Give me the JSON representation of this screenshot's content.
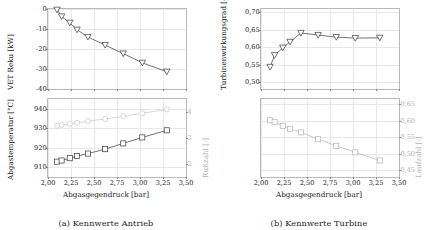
{
  "figure": {
    "subfigures": [
      {
        "tag": "(a)",
        "caption": "(a) Kennwerte Antrieb"
      },
      {
        "tag": "(b)",
        "caption": "(b) Kennwerte Turbine"
      }
    ],
    "xaxis_title": "Abgasgegendruck [bar]",
    "xticks": [
      "2,00",
      "2,25",
      "2,50",
      "2,75",
      "3,00",
      "3,25",
      "3,50"
    ]
  },
  "chart_data": [
    {
      "type": "line",
      "title": "(a) Kennwerte Antrieb",
      "panel": "top-left",
      "xlabel": "Abgasgegendruck [bar]",
      "ylabel": "VET Reku [kW]",
      "xlim": [
        2.0,
        3.5
      ],
      "ylim": [
        -40,
        0
      ],
      "xticks": [
        2.0,
        2.25,
        2.5,
        2.75,
        3.0,
        3.25,
        3.5
      ],
      "yticks": [
        0,
        -10,
        -20,
        -30,
        -40
      ],
      "ytick_labels": [
        "0",
        "-10",
        "-20",
        "-30",
        "-40"
      ],
      "grid": true,
      "legend": "none",
      "series": [
        {
          "name": "VET Reku",
          "marker": "triangle-down",
          "color": "#333333",
          "x": [
            2.1,
            2.15,
            2.24,
            2.32,
            2.44,
            2.63,
            2.83,
            3.04,
            3.31
          ],
          "y": [
            -0.4,
            -3.8,
            -7.0,
            -10.5,
            -14.2,
            -18.3,
            -22.6,
            -27.3,
            -31.8
          ]
        }
      ]
    },
    {
      "type": "line",
      "title": "(a) Kennwerte Antrieb",
      "panel": "bottom-left",
      "xlabel": "Abgasgegendruck [bar]",
      "ylabel": "Abgastemperatur [°C]",
      "y2label": "Rußzahl [-]",
      "xlim": [
        2.0,
        3.5
      ],
      "ylim": [
        905,
        945
      ],
      "y2lim": [
        1.5,
        4.5
      ],
      "xticks": [
        2.0,
        2.25,
        2.5,
        2.75,
        3.0,
        3.25,
        3.5
      ],
      "yticks": [
        910,
        920,
        930,
        940
      ],
      "ytick_labels": [
        "910",
        "920",
        "930",
        "940"
      ],
      "y2ticks": [
        2,
        3,
        4
      ],
      "y2tick_labels": [
        "2",
        "3",
        "4"
      ],
      "grid": true,
      "legend": "none",
      "series": [
        {
          "name": "Abgastemperatur",
          "marker": "square",
          "color": "#333333",
          "x": [
            2.1,
            2.15,
            2.24,
            2.32,
            2.44,
            2.63,
            2.83,
            3.04,
            3.31
          ],
          "y": [
            912.4,
            913.0,
            914.2,
            915.3,
            916.6,
            918.9,
            921.9,
            925.0,
            928.7
          ]
        },
        {
          "name": "Rußzahl",
          "marker": "circle",
          "color": "#c4c4c4",
          "x": [
            2.1,
            2.15,
            2.24,
            2.32,
            2.44,
            2.63,
            2.83,
            3.04,
            3.31
          ],
          "y": [
            931.0,
            931.4,
            932.1,
            932.6,
            933.5,
            934.6,
            936.0,
            937.6,
            939.6
          ]
        }
      ]
    },
    {
      "type": "line",
      "title": "(b) Kennwerte Turbine",
      "panel": "top-right",
      "xlabel": "Abgasgegendruck [bar]",
      "ylabel": "Turbinenwirkungsgrad [-]",
      "xlim": [
        2.0,
        3.5
      ],
      "ylim": [
        0.48,
        0.71
      ],
      "xticks": [
        2.0,
        2.25,
        2.5,
        2.75,
        3.0,
        3.25,
        3.5
      ],
      "yticks": [
        0.5,
        0.55,
        0.6,
        0.65,
        0.7
      ],
      "ytick_labels": [
        "0,50",
        "0,55",
        "0,60",
        "0,65",
        "0,70"
      ],
      "grid": true,
      "legend": "none",
      "series": [
        {
          "name": "Turbinenwirkungsgrad",
          "marker": "triangle-down",
          "color": "#333333",
          "x": [
            2.1,
            2.15,
            2.24,
            2.32,
            2.44,
            2.63,
            2.83,
            3.04,
            3.31
          ],
          "y": [
            0.541,
            0.575,
            0.597,
            0.614,
            0.64,
            0.634,
            0.628,
            0.625,
            0.626
          ]
        }
      ]
    },
    {
      "type": "line",
      "title": "(b) Kennwerte Turbine",
      "panel": "bottom-right",
      "xlabel": "Abgasgegendruck [bar]",
      "y2label": "Laufzahl [-]",
      "xlim": [
        2.0,
        3.5
      ],
      "y2lim": [
        0.43,
        0.665
      ],
      "xticks": [
        2.0,
        2.25,
        2.5,
        2.75,
        3.0,
        3.25,
        3.5
      ],
      "y2ticks": [
        0.45,
        0.5,
        0.55,
        0.6,
        0.65
      ],
      "y2tick_labels": [
        "0,45",
        "0,50",
        "0,55",
        "0,60",
        "0,65"
      ],
      "grid": true,
      "legend": "none",
      "series": [
        {
          "name": "Laufzahl",
          "marker": "square",
          "color": "#b0b0b0",
          "x": [
            2.1,
            2.15,
            2.24,
            2.32,
            2.44,
            2.63,
            2.83,
            3.04,
            3.31
          ],
          "y": [
            0.6,
            0.594,
            0.583,
            0.574,
            0.563,
            0.542,
            0.522,
            0.502,
            0.477
          ]
        }
      ]
    }
  ]
}
